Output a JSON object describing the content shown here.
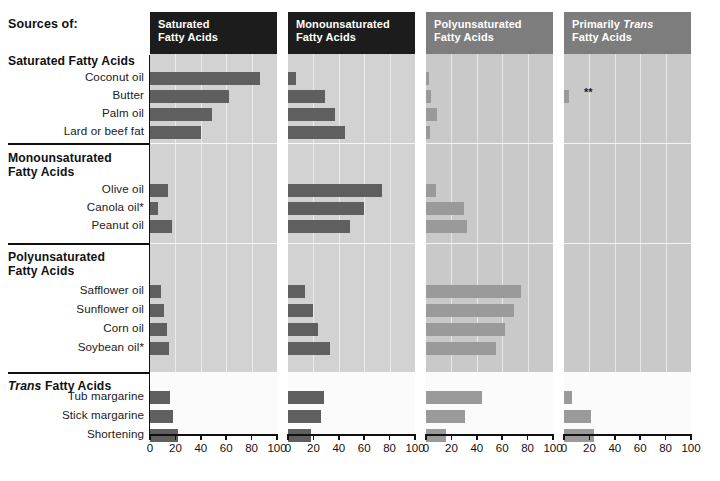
{
  "header": {
    "sources_label": "Sources of:"
  },
  "axis": {
    "ticks": [
      0,
      20,
      40,
      60,
      80,
      100
    ],
    "tick_labels": [
      "0",
      "20",
      "40",
      "60",
      "80",
      "100"
    ],
    "min": 0,
    "max": 100
  },
  "footnote_marker": "**",
  "colors": {
    "panel_head_dark": "#1c1c1c",
    "panel_head_mid": "#7d7d7d",
    "plot_bg": "#d2d2d2",
    "plot_bg_light": "#c9c9c9",
    "bar_dark": "#5f5f5f",
    "bar_light": "#9a9a9a",
    "text": "#111111"
  },
  "panels": [
    {
      "title_line1": "Saturated",
      "title_line2": "Fatty Acids",
      "style": "dark",
      "italic_word": ""
    },
    {
      "title_line1": "Monounsaturated",
      "title_line2": "Fatty Acids",
      "style": "dark",
      "italic_word": ""
    },
    {
      "title_line1": "Polyunsaturated",
      "title_line2": "Fatty Acids",
      "style": "mid",
      "italic_word": ""
    },
    {
      "title_line1": "Primarily Trans",
      "title_line2": "Fatty Acids",
      "style": "mid",
      "italic_word": "Trans"
    }
  ],
  "groups": [
    {
      "heading_line1": "Saturated Fatty Acids",
      "heading_line2": "",
      "italic_word": "",
      "rows": [
        "Coconut oil",
        "Butter",
        "Palm oil",
        "Lard or beef fat"
      ]
    },
    {
      "heading_line1": "Monounsaturated",
      "heading_line2": "Fatty Acids",
      "italic_word": "",
      "rows": [
        "Olive oil",
        "Canola oil*",
        "Peanut oil"
      ]
    },
    {
      "heading_line1": "Polyunsaturated",
      "heading_line2": "Fatty Acids",
      "italic_word": "",
      "rows": [
        "Safflower oil",
        "Sunflower oil",
        "Corn oil",
        "Soybean oil*"
      ]
    },
    {
      "heading_line1": "Trans Fatty Acids",
      "heading_line2": "",
      "italic_word": "Trans",
      "rows": [
        "Tub margarine",
        "Stick margarine",
        "Shortening"
      ]
    }
  ],
  "chart_data": {
    "type": "bar",
    "xlabel": "",
    "ylabel": "",
    "xlim": [
      0,
      100
    ],
    "grid": true,
    "legend": "none",
    "orientation": "horizontal",
    "categories": [
      "Coconut oil",
      "Butter",
      "Palm oil",
      "Lard or beef fat",
      "Olive oil",
      "Canola oil*",
      "Peanut oil",
      "Safflower oil",
      "Sunflower oil",
      "Corn oil",
      "Soybean oil*",
      "Tub margarine",
      "Stick margarine",
      "Shortening"
    ],
    "series": [
      {
        "name": "Saturated Fatty Acids",
        "values": [
          87,
          62,
          49,
          40,
          14,
          6,
          17,
          9,
          11,
          13,
          15,
          16,
          18,
          22
        ]
      },
      {
        "name": "Monounsaturated Fatty Acids",
        "values": [
          6,
          29,
          37,
          45,
          74,
          60,
          49,
          13,
          20,
          24,
          33,
          28,
          26,
          18
        ]
      },
      {
        "name": "Polyunsaturated Fatty Acids",
        "values": [
          2,
          4,
          9,
          3,
          8,
          30,
          32,
          75,
          69,
          62,
          55,
          44,
          31,
          16
        ]
      },
      {
        "name": "Primarily Trans Fatty Acids",
        "values": [
          0,
          4,
          0,
          0,
          0,
          0,
          0,
          0,
          0,
          0,
          0,
          6,
          21,
          24
        ]
      }
    ]
  }
}
